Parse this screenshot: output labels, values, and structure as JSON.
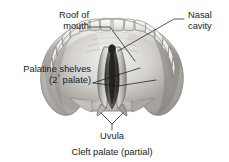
{
  "figure": {
    "caption": "Cleft palate (partial)",
    "background_color": "#ffffff",
    "text_color": "#1a1a1a",
    "leader_line_color": "#111111"
  },
  "labels": {
    "roof_of_mouth": {
      "line1": "Roof of",
      "line2": "mouth",
      "name": "Roof of mouth"
    },
    "nasal_cavity": {
      "line1": "Nasal",
      "line2": "cavity",
      "name": "Nasal cavity"
    },
    "palatine_shelves": {
      "line1": "Palatine shelves",
      "line2_pre": "(2",
      "line2_sup": "°",
      "line2_post": " palate)",
      "name": "Palatine shelves (2° palate)"
    },
    "uvula": {
      "text": "Uvula",
      "name": "Uvula"
    }
  },
  "illustration": {
    "name": "oral-cavity-palate-illustration",
    "description": "Inferior view of hard palate with teeth arch and a partial midline cleft",
    "colors": {
      "palate_light": "#e8e6e3",
      "palate_mid": "#c9c6c2",
      "palate_dark": "#9a9793",
      "teeth": "#f2f1ef",
      "tooth_outline": "#8d8a86",
      "cleft_dark": "#3a3a3a",
      "cleft_deep": "#1d1d1d",
      "outline": "#6f6c68"
    }
  }
}
